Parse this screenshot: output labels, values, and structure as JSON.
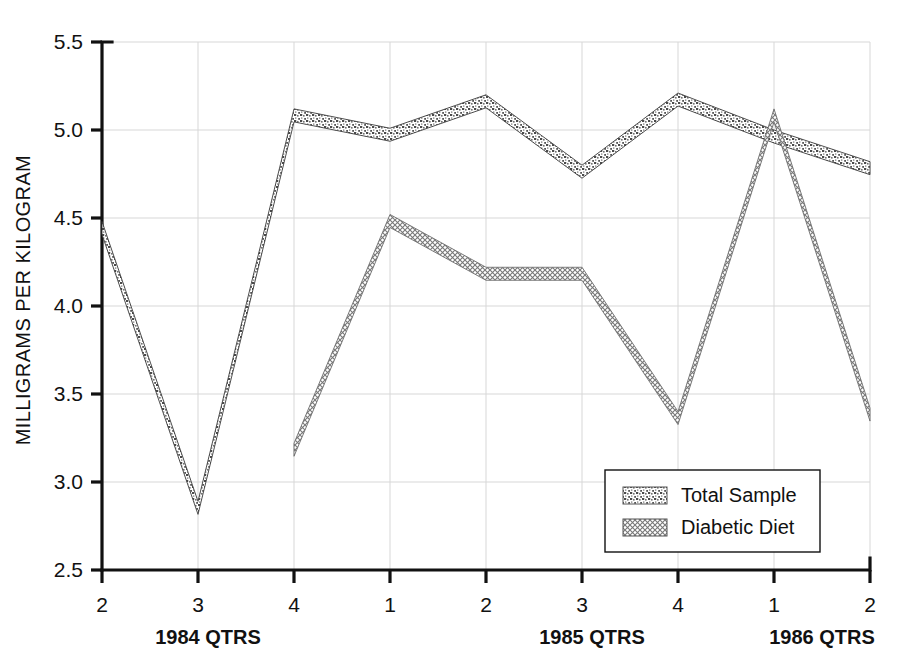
{
  "chart_data": {
    "type": "line",
    "title": "",
    "xlabel": "",
    "ylabel": "MILLIGRAMS PER KILOGRAM",
    "ylim": [
      2.5,
      5.5
    ],
    "ytick_labels": [
      "2.5",
      "3.0",
      "3.5",
      "4.0",
      "4.5",
      "5.0",
      "5.5"
    ],
    "ytick_values": [
      2.5,
      3.0,
      3.5,
      4.0,
      4.5,
      5.0,
      5.5
    ],
    "x_tick_labels": [
      "2",
      "3",
      "4",
      "1",
      "2",
      "3",
      "4",
      "1",
      "2"
    ],
    "x_group_labels": [
      "1984 QTRS",
      "1985 QTRS",
      "1986 QTRS"
    ],
    "grid": true,
    "legend_position": "bottom-right",
    "categories": [
      "1984 Q2",
      "1984 Q3",
      "1984 Q4",
      "1985 Q1",
      "1985 Q2",
      "1985 Q3",
      "1985 Q4",
      "1986 Q1",
      "1986 Q2"
    ],
    "series": [
      {
        "name": "Total Sample",
        "pattern": "speckled",
        "color": "#6b6b6b",
        "values": [
          4.48,
          2.89,
          5.12,
          5.01,
          5.2,
          4.8,
          5.21,
          5.0,
          4.82
        ]
      },
      {
        "name": "Diabetic Diet",
        "pattern": "crosshatch",
        "color": "#8f8f8f",
        "values": [
          null,
          null,
          3.22,
          4.52,
          4.22,
          4.22,
          3.4,
          5.12,
          3.42
        ]
      }
    ]
  },
  "legend": {
    "items": [
      {
        "label": "Total Sample"
      },
      {
        "label": "Diabetic Diet"
      }
    ]
  },
  "axes": {
    "y_axis_title": "MILLIGRAMS PER KILOGRAM"
  }
}
